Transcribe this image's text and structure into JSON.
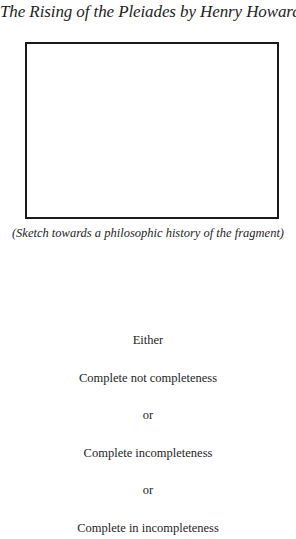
{
  "title": "The Rising of the Pleiades by Henry Howard",
  "sketch_box": {
    "content": ""
  },
  "caption": "(Sketch towards a philosophic history of the fragment)",
  "lines": [
    "Either",
    "Complete not completeness",
    "or",
    "Complete incompleteness",
    "or",
    "Complete in incompleteness"
  ]
}
